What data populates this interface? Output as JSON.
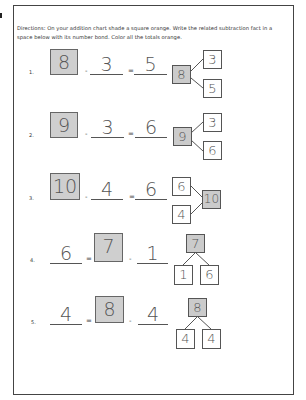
{
  "directions": "Directions: On your addition chart shade a square orange. Write the related subtraction fact in a space below with its number bond. Color all the totals orange.",
  "problems": [
    {
      "label": "1.",
      "a": "8",
      "op1": "-",
      "b": "3",
      "op2": "=",
      "c": "5",
      "bond_total": "8",
      "bond_parts": [
        "3",
        "5"
      ]
    },
    {
      "label": "2.",
      "a": "9",
      "op1": "-",
      "b": "3",
      "op2": "=",
      "c": "6",
      "bond_total": "9",
      "bond_parts": [
        "3",
        "6"
      ]
    },
    {
      "label": "3.",
      "a": "10",
      "op1": "-",
      "b": "4",
      "op2": "=",
      "c": "6",
      "bond_total": "10",
      "bond_parts": [
        "6",
        "4"
      ]
    },
    {
      "label": "4.",
      "a": "6",
      "op1": "=",
      "b": "7",
      "op2": "-",
      "c": "1",
      "bond_total": "7",
      "bond_parts": [
        "1",
        "6"
      ]
    },
    {
      "label": "5.",
      "a": "4",
      "op1": "=",
      "b": "8",
      "op2": "-",
      "c": "4",
      "bond_total": "8",
      "bond_parts": [
        "4",
        "4"
      ]
    }
  ],
  "colors": {
    "shade": "#cfcfcf",
    "border": "#444444"
  }
}
